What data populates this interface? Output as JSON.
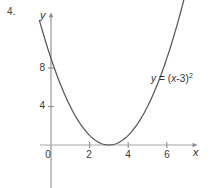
{
  "figure": {
    "problem_number": "4.",
    "background_color": "#ffffff",
    "curve_color": "#595959",
    "axis_color": "#9a9a9a",
    "text_color": "#333333",
    "width": 212,
    "height": 188
  },
  "axes": {
    "x_label": "x",
    "y_label": "y",
    "origin_px": {
      "x": 51,
      "y": 145
    },
    "x_unit_px": 19.3,
    "y_unit_px": 9.62,
    "x_axis_line": {
      "x1": 40,
      "x2": 197,
      "y": 145
    },
    "y_axis_line": {
      "x": 51,
      "y1": 13,
      "y2": 188
    },
    "x_arrow": true,
    "y_arrow": true
  },
  "chart_data": {
    "type": "line",
    "title": "",
    "subtitle": "",
    "xlabel": "x",
    "ylabel": "y",
    "grid": false,
    "legend_position": "none",
    "xlim": [
      -0.6,
      7.5
    ],
    "ylim": [
      -4.5,
      13.7
    ],
    "xticks": [
      0,
      2,
      4,
      6
    ],
    "xtick_labels": [
      "0",
      "2",
      "4",
      "6"
    ],
    "yticks": [
      4,
      8
    ],
    "ytick_labels": [
      "4",
      "8"
    ],
    "annotations": [
      {
        "text": "y = (x-3)²",
        "x": 8.2,
        "y": 6.8
      }
    ],
    "series": [
      {
        "name": "y = (x-3)^2",
        "equation": "y = (x-3)^2",
        "vertex": [
          3,
          0
        ],
        "x": [
          -0.35,
          0,
          0.5,
          1,
          1.5,
          2,
          2.5,
          3,
          3.5,
          4,
          4.5,
          5,
          5.5,
          6,
          6.5,
          6.8
        ],
        "values": [
          11.22,
          9,
          6.25,
          4,
          2.25,
          1,
          0.25,
          0,
          0.25,
          1,
          2.25,
          4,
          6.25,
          9,
          12.25,
          14.44
        ]
      }
    ]
  },
  "labels": {
    "equation": {
      "lhs": "y",
      "eq": " = (",
      "var": "x",
      "rest": "-3)",
      "exponent": "2"
    }
  }
}
